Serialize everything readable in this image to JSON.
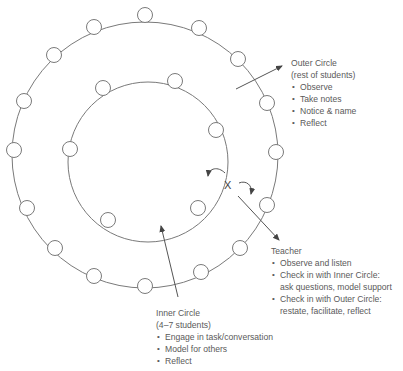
{
  "diagram": {
    "colors": {
      "line": "#7a7a7a",
      "text": "#5a5a5a",
      "background": "#ffffff"
    },
    "outer_ring": {
      "cx": 145,
      "cy": 155,
      "r": 133
    },
    "inner_ring": {
      "cx": 148,
      "cy": 162,
      "r": 80
    },
    "outer_students": [
      {
        "x": 145,
        "y": 15
      },
      {
        "x": 199,
        "y": 28
      },
      {
        "x": 238,
        "y": 59
      },
      {
        "x": 267,
        "y": 103
      },
      {
        "x": 276,
        "y": 152
      },
      {
        "x": 267,
        "y": 205
      },
      {
        "x": 240,
        "y": 248
      },
      {
        "x": 201,
        "y": 272
      },
      {
        "x": 145,
        "y": 286
      },
      {
        "x": 94,
        "y": 276
      },
      {
        "x": 55,
        "y": 248
      },
      {
        "x": 27,
        "y": 208
      },
      {
        "x": 14,
        "y": 150
      },
      {
        "x": 24,
        "y": 101
      },
      {
        "x": 54,
        "y": 55
      },
      {
        "x": 94,
        "y": 27
      }
    ],
    "inner_students": [
      {
        "x": 103,
        "y": 88
      },
      {
        "x": 175,
        "y": 81
      },
      {
        "x": 216,
        "y": 130
      },
      {
        "x": 70,
        "y": 149
      },
      {
        "x": 108,
        "y": 220
      },
      {
        "x": 198,
        "y": 208
      }
    ],
    "teacher_marker": "X"
  },
  "outer_circle": {
    "title": "Outer Circle",
    "subtitle": "(rest of students)",
    "items": [
      "Observe",
      "Take notes",
      "Notice & name",
      "Reflect"
    ]
  },
  "inner_circle": {
    "title": "Inner Circle",
    "subtitle": "(4–7 students)",
    "items": [
      "Engage in task/conversation",
      "Model for others",
      "Reflect"
    ]
  },
  "teacher": {
    "title": "Teacher",
    "items": [
      {
        "line1": "Observe and listen"
      },
      {
        "line1": "Check in with Inner Circle:",
        "line2": "ask questions, model support"
      },
      {
        "line1": "Check in with Outer Circle:",
        "line2": "restate, facilitate, reflect"
      }
    ]
  }
}
